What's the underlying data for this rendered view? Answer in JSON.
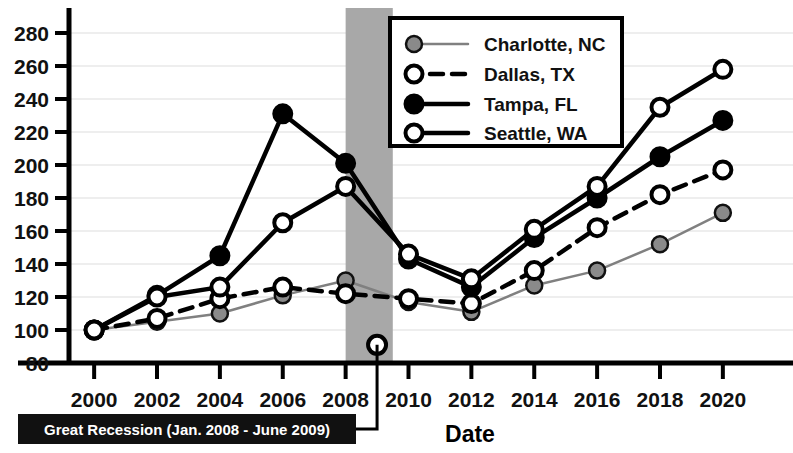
{
  "chart_data": {
    "type": "line",
    "title": "",
    "xlabel": "Date",
    "ylabel": "",
    "x": [
      2000,
      2002,
      2004,
      2006,
      2008,
      2010,
      2012,
      2014,
      2016,
      2018,
      2020
    ],
    "xticklabels": [
      "2000",
      "2002",
      "2004",
      "2006",
      "2008",
      "2010",
      "2012",
      "2014",
      "2016",
      "2018",
      "2020"
    ],
    "yticklabels": [
      "80",
      "100",
      "120",
      "140",
      "160",
      "180",
      "200",
      "220",
      "240",
      "260",
      "280"
    ],
    "yticks": [
      80,
      100,
      120,
      140,
      160,
      180,
      200,
      220,
      240,
      260,
      280
    ],
    "xlim": [
      1999.2,
      2020.8
    ],
    "ylim": [
      74,
      288
    ],
    "grid": true,
    "legend_position": "top-center-right",
    "series": [
      {
        "name": "Charlotte, NC",
        "marker": "filled-gray-circle",
        "line": "thin-gray-solid",
        "color": "#808080",
        "values": [
          100,
          105,
          110,
          121,
          130,
          117,
          111,
          127,
          136,
          152,
          171
        ]
      },
      {
        "name": "Dallas, TX",
        "marker": "open-circle",
        "line": "black-dashed",
        "color": "#000000",
        "values": [
          100,
          107,
          119,
          126,
          122,
          119,
          116,
          136,
          162,
          182,
          197
        ]
      },
      {
        "name": "Tampa, FL",
        "marker": "filled-black-circle",
        "line": "black-solid",
        "color": "#000000",
        "values": [
          100,
          121,
          145,
          231,
          201,
          143,
          126,
          156,
          180,
          205,
          227
        ]
      },
      {
        "name": "Seattle, WA",
        "marker": "open-circle",
        "line": "black-solid",
        "color": "#000000",
        "values": [
          100,
          120,
          126,
          165,
          187,
          146,
          131,
          161,
          187,
          235,
          258
        ]
      }
    ],
    "annotations": [
      {
        "id": "great-recession",
        "label": "Great Recession (Jan. 2008 - June 2009)",
        "band_start": 2008.0,
        "band_end": 2009.5,
        "band_color": "#a8a8a8",
        "marker_x": 2009,
        "marker_y": 91,
        "marker": "open-circle"
      }
    ]
  },
  "legend": {
    "items": [
      {
        "label": "Charlotte, NC"
      },
      {
        "label": "Dallas, TX"
      },
      {
        "label": "Tampa, FL"
      },
      {
        "label": "Seattle, WA"
      }
    ]
  },
  "colors": {
    "background": "#ffffff",
    "axis": "#000000",
    "grid": "#eeeeee",
    "recession_band": "#a8a8a8",
    "annotation_bg": "#111111",
    "annotation_fg": "#ffffff",
    "charlotte": "#808080",
    "series_black": "#000000"
  }
}
